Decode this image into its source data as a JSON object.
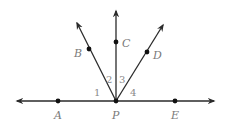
{
  "diagram": {
    "type": "rays-from-point",
    "stroke_color": "#2a2a2a",
    "label_color": "#7a7a7a",
    "vertex": {
      "label": "P",
      "x": 116,
      "y": 101
    },
    "line": {
      "name": "line AE",
      "points": [
        {
          "label": "A",
          "x": 58,
          "y": 101
        },
        {
          "label": "E",
          "x": 175,
          "y": 101
        }
      ]
    },
    "rays": [
      {
        "name": "ray PB",
        "point": {
          "label": "B",
          "x": 89,
          "y": 49
        }
      },
      {
        "name": "ray PC",
        "point": {
          "label": "C",
          "x": 116,
          "y": 42
        }
      },
      {
        "name": "ray PD",
        "point": {
          "label": "D",
          "x": 147,
          "y": 52
        }
      }
    ],
    "angles": [
      {
        "label": "1",
        "between": "PA and PB"
      },
      {
        "label": "2",
        "between": "PB and PC"
      },
      {
        "label": "3",
        "between": "PC and PD"
      },
      {
        "label": "4",
        "between": "PD and PE"
      }
    ]
  }
}
